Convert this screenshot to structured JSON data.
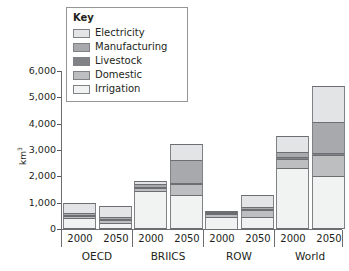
{
  "chart_data": {
    "type": "bar",
    "stacked": true,
    "title": "",
    "xlabel": "",
    "ylabel": "km³",
    "ylim": [
      0,
      6000
    ],
    "ytick_labels": [
      "6,000",
      "5,000",
      "4,000",
      "3,000",
      "2,000",
      "1,000",
      "0"
    ],
    "ytick_values": [
      6000,
      5000,
      4000,
      3000,
      2000,
      1000,
      0
    ],
    "grid": false,
    "legend": {
      "title": "Key",
      "position": "top-left-inset",
      "entries": [
        {
          "label": "Electricity",
          "color": "#e3e4e5"
        },
        {
          "label": "Manufacturing",
          "color": "#a7a9ac"
        },
        {
          "label": "Livestock",
          "color": "#808285"
        },
        {
          "label": "Domestic",
          "color": "#bcbec0"
        },
        {
          "label": "Irrigation",
          "color": "#f1f2f2"
        }
      ]
    },
    "groups": [
      "OECD",
      "BRIICS",
      "ROW",
      "World"
    ],
    "categories": [
      "2000",
      "2050",
      "2000",
      "2050",
      "2000",
      "2050",
      "2000",
      "2050"
    ],
    "series": [
      {
        "name": "Irrigation",
        "color": "#f1f2f2",
        "values": [
          430,
          250,
          1430,
          1280,
          500,
          460,
          2330,
          2000
        ]
      },
      {
        "name": "Domestic",
        "color": "#bcbec0",
        "values": [
          90,
          110,
          130,
          430,
          90,
          260,
          310,
          800
        ]
      },
      {
        "name": "Livestock",
        "color": "#808285",
        "values": [
          30,
          30,
          40,
          50,
          20,
          30,
          90,
          80
        ]
      },
      {
        "name": "Manufacturing",
        "color": "#a7a9ac",
        "values": [
          60,
          70,
          110,
          870,
          30,
          100,
          200,
          1180
        ]
      },
      {
        "name": "Electricity",
        "color": "#e3e4e5",
        "values": [
          390,
          420,
          120,
          600,
          60,
          440,
          620,
          1380
        ]
      }
    ],
    "totals": [
      1000,
      880,
      1830,
      3230,
      700,
      1290,
      3550,
      5440
    ],
    "bars": [
      {
        "group": "OECD",
        "year": "2000",
        "total": 1000,
        "segments": [
          {
            "name": "Irrigation",
            "value": 430
          },
          {
            "name": "Domestic",
            "value": 90
          },
          {
            "name": "Livestock",
            "value": 30
          },
          {
            "name": "Manufacturing",
            "value": 60
          },
          {
            "name": "Electricity",
            "value": 390
          }
        ]
      },
      {
        "group": "OECD",
        "year": "2050",
        "total": 880,
        "segments": [
          {
            "name": "Irrigation",
            "value": 250
          },
          {
            "name": "Domestic",
            "value": 110
          },
          {
            "name": "Livestock",
            "value": 30
          },
          {
            "name": "Manufacturing",
            "value": 70
          },
          {
            "name": "Electricity",
            "value": 420
          }
        ]
      },
      {
        "group": "BRIICS",
        "year": "2000",
        "total": 1830,
        "segments": [
          {
            "name": "Irrigation",
            "value": 1430
          },
          {
            "name": "Domestic",
            "value": 130
          },
          {
            "name": "Livestock",
            "value": 40
          },
          {
            "name": "Manufacturing",
            "value": 110
          },
          {
            "name": "Electricity",
            "value": 120
          }
        ]
      },
      {
        "group": "BRIICS",
        "year": "2050",
        "total": 3230,
        "segments": [
          {
            "name": "Irrigation",
            "value": 1280
          },
          {
            "name": "Domestic",
            "value": 430
          },
          {
            "name": "Livestock",
            "value": 50
          },
          {
            "name": "Manufacturing",
            "value": 870
          },
          {
            "name": "Electricity",
            "value": 600
          }
        ]
      },
      {
        "group": "ROW",
        "year": "2000",
        "total": 700,
        "segments": [
          {
            "name": "Irrigation",
            "value": 500
          },
          {
            "name": "Domestic",
            "value": 90
          },
          {
            "name": "Livestock",
            "value": 20
          },
          {
            "name": "Manufacturing",
            "value": 30
          },
          {
            "name": "Electricity",
            "value": 60
          }
        ]
      },
      {
        "group": "ROW",
        "year": "2050",
        "total": 1290,
        "segments": [
          {
            "name": "Irrigation",
            "value": 460
          },
          {
            "name": "Domestic",
            "value": 260
          },
          {
            "name": "Livestock",
            "value": 30
          },
          {
            "name": "Manufacturing",
            "value": 100
          },
          {
            "name": "Electricity",
            "value": 440
          }
        ]
      },
      {
        "group": "World",
        "year": "2000",
        "total": 3550,
        "segments": [
          {
            "name": "Irrigation",
            "value": 2330
          },
          {
            "name": "Domestic",
            "value": 310
          },
          {
            "name": "Livestock",
            "value": 90
          },
          {
            "name": "Manufacturing",
            "value": 200
          },
          {
            "name": "Electricity",
            "value": 620
          }
        ]
      },
      {
        "group": "World",
        "year": "2050",
        "total": 5440,
        "segments": [
          {
            "name": "Irrigation",
            "value": 2000
          },
          {
            "name": "Domestic",
            "value": 800
          },
          {
            "name": "Livestock",
            "value": 80
          },
          {
            "name": "Manufacturing",
            "value": 1180
          },
          {
            "name": "Electricity",
            "value": 1380
          }
        ]
      }
    ]
  },
  "axis": {
    "y_title_text": "km",
    "y_title_sup": "3"
  },
  "colors": {
    "axis": "#6d6e71",
    "outline": "#808285",
    "text": "#231f20",
    "background": "#ffffff"
  }
}
